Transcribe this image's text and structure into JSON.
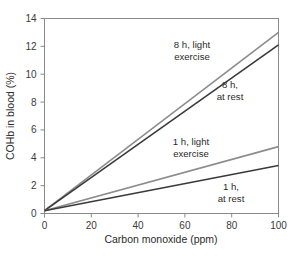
{
  "chart_data": {
    "type": "line",
    "title": "",
    "xlabel": "Carbon monoxide (ppm)",
    "ylabel": "COHb in blood (%)",
    "xlim": [
      0,
      100
    ],
    "ylim": [
      0,
      14
    ],
    "xticks": [
      0,
      20,
      40,
      60,
      80,
      100
    ],
    "yticks": [
      0,
      2,
      4,
      6,
      8,
      10,
      12,
      14
    ],
    "xtick_labels": [
      "0",
      "20",
      "40",
      "60",
      "80",
      "100"
    ],
    "ytick_labels": [
      "0",
      "2",
      "4",
      "6",
      "8",
      "10",
      "12",
      "14"
    ],
    "grid": false,
    "legend": "inline-annotations",
    "series": [
      {
        "name": "8 h, light exercise",
        "label_lines": [
          "8 h, light",
          "exercise"
        ],
        "color": "#8c8c8c",
        "x": [
          0,
          100
        ],
        "values": [
          0.2,
          13.0
        ]
      },
      {
        "name": "8 h, at rest",
        "label_lines": [
          "8 h,",
          "at rest"
        ],
        "color": "#3a3a3a",
        "x": [
          0,
          100
        ],
        "values": [
          0.2,
          12.1
        ]
      },
      {
        "name": "1 h, light exercise",
        "label_lines": [
          "1 h, light",
          "exercise"
        ],
        "color": "#8c8c8c",
        "x": [
          0,
          100
        ],
        "values": [
          0.2,
          4.8
        ]
      },
      {
        "name": "1 h, at rest",
        "label_lines": [
          "1 h,",
          "at rest"
        ],
        "color": "#3a3a3a",
        "x": [
          0,
          100
        ],
        "values": [
          0.2,
          3.45
        ]
      }
    ]
  },
  "axes": {
    "frame_color": "#8a8a8a",
    "tick_color": "#8a8a8a"
  }
}
